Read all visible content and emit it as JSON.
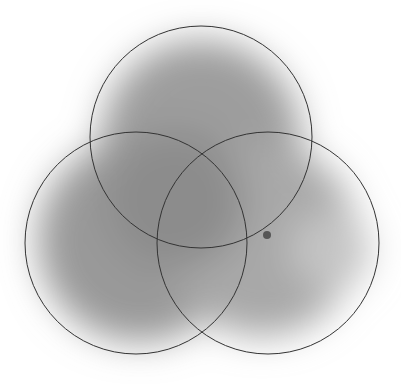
{
  "diagram": {
    "type": "venn-3",
    "canvas": {
      "width": 401,
      "height": 385,
      "background": "#ffffff"
    },
    "stroke_color": "#333333",
    "stroke_width": 1,
    "shading": {
      "color_dark": "#8a8a8a",
      "color_light": "#ffffff",
      "blur": 18
    },
    "circles": [
      {
        "id": "top",
        "cx": 201,
        "cy": 137,
        "r": 111
      },
      {
        "id": "left",
        "cx": 136,
        "cy": 243,
        "r": 111
      },
      {
        "id": "right",
        "cx": 268,
        "cy": 243,
        "r": 111
      }
    ],
    "marker": {
      "cx": 267,
      "cy": 235,
      "r": 4,
      "color": "#555555"
    }
  }
}
